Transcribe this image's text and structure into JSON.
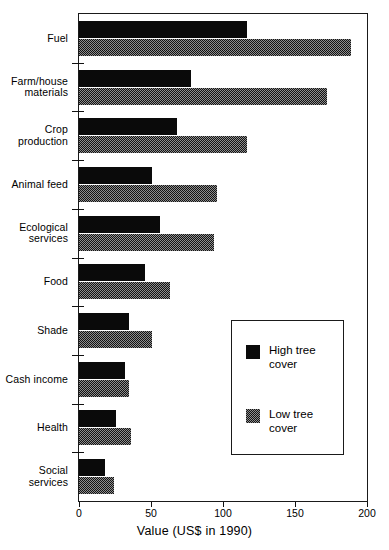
{
  "chart_data": {
    "type": "bar",
    "orientation": "horizontal",
    "title": "",
    "xlabel": "Value (US$ in 1990)",
    "ylabel": "",
    "xlim": [
      0,
      200
    ],
    "xticks": [
      0,
      50,
      100,
      150,
      200
    ],
    "xtick_labels": [
      "0",
      "50",
      "100",
      "150",
      "200"
    ],
    "grid": false,
    "legend_position": "center-right-inside",
    "categories": [
      "Fuel",
      "Farm/house\nmaterials",
      "Crop\nproduction",
      "Animal feed",
      "Ecological\nservices",
      "Food",
      "Shade",
      "Cash income",
      "Health",
      "Social services"
    ],
    "series": [
      {
        "name": "High tree cover",
        "color": "#0a0a0a",
        "values": [
          117,
          78,
          68,
          51,
          56,
          46,
          35,
          32,
          26,
          18
        ]
      },
      {
        "name": "Low tree cover",
        "color": "#121212",
        "values": [
          189,
          172,
          117,
          96,
          94,
          63,
          51,
          35,
          36,
          24
        ]
      }
    ]
  },
  "legend": {
    "entries": [
      {
        "label": "High tree\ncover",
        "swatch": "solid-black-swatch"
      },
      {
        "label": "Low tree\ncover",
        "swatch": "dithered-gray-swatch"
      }
    ]
  },
  "axis": {
    "x_title": "Value (US$ in 1990)"
  }
}
